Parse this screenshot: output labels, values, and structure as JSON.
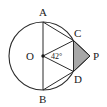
{
  "figure": {
    "type": "geometry-diagram",
    "background_color": "#ffffff",
    "stroke_color": "#2b2b2b",
    "label_color": "#1a1a1a",
    "shade_color": "#a8a8a8",
    "circle": {
      "center_label": "O",
      "center_x": 43,
      "center_y": 56,
      "radius": 34
    },
    "points": [
      {
        "id": "A",
        "label": "A",
        "x": 43,
        "y": 22,
        "label_x": 39,
        "label_y": 16,
        "on_circle": true
      },
      {
        "id": "B",
        "label": "B",
        "x": 43,
        "y": 90,
        "label_x": 39,
        "label_y": 103,
        "on_circle": true
      },
      {
        "id": "C",
        "label": "C",
        "x": 73.5,
        "y": 40.5,
        "label_x": 74,
        "label_y": 37,
        "on_circle": true
      },
      {
        "id": "D",
        "label": "D",
        "x": 73.5,
        "y": 71.5,
        "label_x": 74,
        "label_y": 83,
        "on_circle": true
      },
      {
        "id": "O",
        "label": "O",
        "x": 43,
        "y": 56,
        "label_x": 26,
        "label_y": 60,
        "on_circle": false
      },
      {
        "id": "P",
        "label": "P",
        "x": 90,
        "y": 56,
        "label_x": 93,
        "label_y": 60,
        "on_circle": false
      }
    ],
    "segments": [
      {
        "name": "diameter-AB",
        "from": "A",
        "to": "B"
      },
      {
        "name": "chord-AC",
        "from": "A",
        "to": "C"
      },
      {
        "name": "chord-BD",
        "from": "B",
        "to": "D"
      },
      {
        "name": "radius-OC",
        "from": "O",
        "to": "C"
      },
      {
        "name": "radius-OD",
        "from": "O",
        "to": "D"
      },
      {
        "name": "tangent-CP",
        "from": "C",
        "to": "P"
      },
      {
        "name": "tangent-DP",
        "from": "D",
        "to": "P"
      },
      {
        "name": "segment-CD",
        "from": "C",
        "to": "D"
      }
    ],
    "angle": {
      "name": "angle-COD",
      "value": "42",
      "unit": "°",
      "text": "42°",
      "vertex": "O",
      "label_x": 52,
      "label_y": 59
    },
    "shaded_region": {
      "name": "triangle-CPD",
      "vertices": [
        "C",
        "P",
        "D"
      ],
      "fill": "#a8a8a8"
    }
  }
}
